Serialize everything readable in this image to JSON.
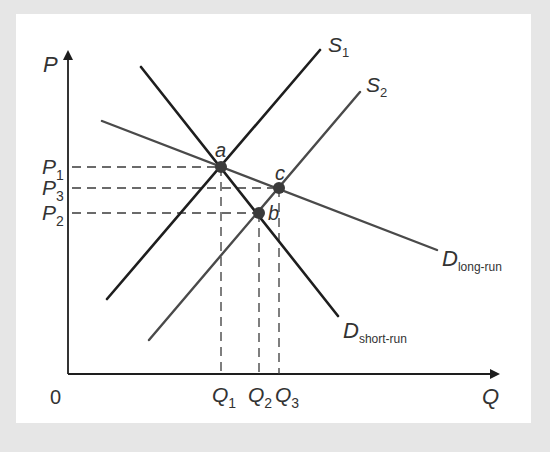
{
  "diagram": {
    "axes": {
      "y_label": "P",
      "x_label": "Q",
      "origin_label": "0"
    },
    "price_levels": [
      {
        "letter": "P",
        "sub": "1"
      },
      {
        "letter": "P",
        "sub": "3"
      },
      {
        "letter": "P",
        "sub": "2"
      }
    ],
    "quantity_levels": [
      {
        "letter": "Q",
        "sub": "1"
      },
      {
        "letter": "Q",
        "sub": "2"
      },
      {
        "letter": "Q",
        "sub": "3"
      }
    ],
    "curves": {
      "s1": {
        "letter": "S",
        "sub": "1"
      },
      "s2": {
        "letter": "S",
        "sub": "2"
      },
      "d_short": {
        "letter": "D",
        "sub": "short-run"
      },
      "d_long": {
        "letter": "D",
        "sub": "long-run"
      }
    },
    "points": {
      "a": "a",
      "b": "b",
      "c": "c"
    },
    "colors": {
      "background": "#e6e6e6",
      "panel": "#ffffff",
      "line_dark": "#1e1e1e",
      "line_gray": "#4a4a4a",
      "text": "#333333",
      "dot": "#3a3a3a"
    }
  }
}
